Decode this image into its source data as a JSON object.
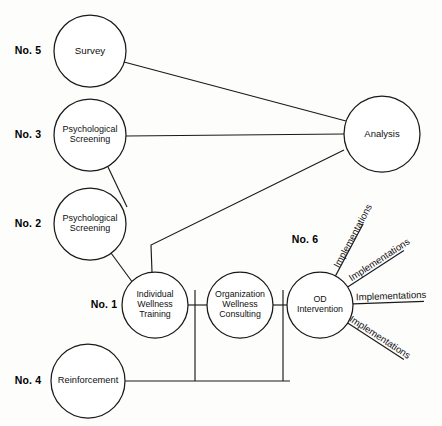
{
  "diagram": {
    "type": "node-link-diagram",
    "canvas": {
      "width": 442,
      "height": 426
    },
    "style": {
      "background_color": "#fdfdfc",
      "line_color": "#1a1a1a",
      "node_fill": "#ffffff",
      "node_stroke": "#1a1a1a",
      "text_color": "#101010"
    },
    "nodes": [
      {
        "id": "survey",
        "label_lines": [
          "Survey"
        ],
        "index_label": "No. 5",
        "index_x": 28,
        "index_y": 51,
        "cx": 90,
        "cy": 51,
        "r": 36,
        "font_size": 9.8,
        "line_height": 10.6
      },
      {
        "id": "psych-screening-3",
        "label_lines": [
          "Psychological",
          "Screening"
        ],
        "index_label": "No. 3",
        "index_x": 28,
        "index_y": 135,
        "cx": 90,
        "cy": 135,
        "r": 36,
        "font_size": 9.0,
        "line_height": 9.8
      },
      {
        "id": "psych-screening-2",
        "label_lines": [
          "Psychological",
          "Screening"
        ],
        "index_label": "No. 2",
        "index_x": 28,
        "index_y": 224,
        "cx": 90,
        "cy": 224,
        "r": 36,
        "font_size": 9.0,
        "line_height": 9.8
      },
      {
        "id": "reinforcement",
        "label_lines": [
          "Reinforcement"
        ],
        "index_label": "No. 4",
        "index_x": 28,
        "index_y": 381,
        "cx": 88,
        "cy": 381,
        "r": 37,
        "font_size": 9.3,
        "line_height": 10.2
      },
      {
        "id": "individual-wellness-training",
        "label_lines": [
          "Individual",
          "Wellness",
          "Training"
        ],
        "index_label": "No. 1",
        "index_x": 104,
        "index_y": 305,
        "cx": 155,
        "cy": 305,
        "r": 33,
        "font_size": 8.8,
        "line_height": 9.6
      },
      {
        "id": "organization-wellness-consulting",
        "label_lines": [
          "Organization",
          "Wellness",
          "Consulting"
        ],
        "index_label": "",
        "index_x": 0,
        "index_y": 0,
        "cx": 240,
        "cy": 305,
        "r": 33,
        "font_size": 8.8,
        "line_height": 9.6
      },
      {
        "id": "od-intervention",
        "label_lines": [
          "OD",
          "Intervention"
        ],
        "index_label": "No. 6",
        "index_x": 305,
        "index_y": 240,
        "cx": 320,
        "cy": 305,
        "r": 33,
        "font_size": 8.8,
        "line_height": 9.6
      },
      {
        "id": "analysis",
        "label_lines": [
          "Analysis"
        ],
        "index_label": "",
        "index_x": 0,
        "index_y": 0,
        "cx": 382,
        "cy": 134,
        "r": 38,
        "font_size": 9.5,
        "line_height": 10.4
      }
    ],
    "edges": [
      {
        "id": "survey-to-analysis",
        "from": "survey",
        "to": "analysis",
        "path": "M 124 62 L 346 121"
      },
      {
        "id": "psych3-to-analysis",
        "from": "psych-screening-3",
        "to": "analysis",
        "path": "M 126 136 L 344 134"
      },
      {
        "id": "iwt-to-analysis",
        "from": "individual-wellness-training",
        "to": "analysis",
        "path": "M 152 272 L 151 245 L 344 150"
      },
      {
        "id": "psych3-to-psych2",
        "from": "psych-screening-3",
        "to": "psych-screening-2",
        "path": "M 108 167 L 127 207"
      },
      {
        "id": "psych2-to-iwt",
        "from": "psych-screening-2",
        "to": "individual-wellness-training",
        "path": "M 111 253 L 133 283"
      },
      {
        "id": "iwt-to-owc",
        "from": "individual-wellness-training",
        "to": "organization-wellness-consulting",
        "path": "M 188 305 L 207 305"
      },
      {
        "id": "owc-to-od",
        "from": "organization-wellness-consulting",
        "to": "od-intervention",
        "path": "M 273 305 L 287 305"
      },
      {
        "id": "reinforcement-trunk",
        "from": "reinforcement",
        "to": "od-intervention",
        "path": "M 125 381 L 290 381"
      },
      {
        "id": "trunk-riser-iwt",
        "from": "reinforcement",
        "to": "individual-wellness-training",
        "path": "M 195 381 L 195 290"
      },
      {
        "id": "trunk-riser-od",
        "from": "reinforcement",
        "to": "od-intervention",
        "path": "M 283 381 L 283 290"
      }
    ],
    "implementation_rays": [
      {
        "id": "implementation-ray-1",
        "label": "Implementations",
        "angle_deg": -62,
        "inner_r": 33,
        "outer_r": 92,
        "label_offset": 6
      },
      {
        "id": "implementation-ray-2",
        "label": "Implementations",
        "angle_deg": -33,
        "inner_r": 33,
        "outer_r": 100,
        "label_offset": 6
      },
      {
        "id": "implementation-ray-3",
        "label": "Implementations",
        "angle_deg": -2,
        "inner_r": 33,
        "outer_r": 104,
        "label_offset": 6
      },
      {
        "id": "implementation-ray-4",
        "label": "Implementations",
        "angle_deg": 33,
        "inner_r": 33,
        "outer_r": 100,
        "label_offset": 6
      }
    ]
  }
}
